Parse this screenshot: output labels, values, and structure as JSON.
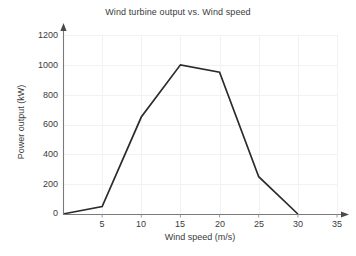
{
  "chart_data": {
    "type": "line",
    "title": "Wind turbine output vs. Wind speed",
    "xlabel": "Wind speed (m/s)",
    "ylabel": "Power output (kW)",
    "x": [
      0,
      5,
      10,
      15,
      20,
      25,
      30
    ],
    "values": [
      0,
      50,
      650,
      1000,
      950,
      250,
      0
    ],
    "series": [
      {
        "name": "Power output",
        "x": [
          0,
          5,
          10,
          15,
          20,
          25,
          30
        ],
        "values": [
          0,
          50,
          650,
          1000,
          950,
          250,
          0
        ]
      }
    ],
    "xlim": [
      0,
      35
    ],
    "ylim": [
      0,
      1200
    ],
    "xticks": [
      0,
      5,
      10,
      15,
      20,
      25,
      30,
      35
    ],
    "xtick_labels": [
      "",
      "5",
      "10",
      "15",
      "20",
      "25",
      "30",
      "35"
    ],
    "yticks": [
      0,
      200,
      400,
      600,
      800,
      1000,
      1200
    ],
    "ytick_labels": [
      "0",
      "200",
      "400",
      "600",
      "800",
      "1000",
      "1200"
    ],
    "grid": true,
    "legend": null,
    "legend_position": "none",
    "line_color": "#2b2b2b",
    "grid_color": "#f2f2f4",
    "axis_color": "#7a7a7a",
    "text_color": "#3b3b3b",
    "background_color": "#ffffff",
    "markers": false,
    "axis_arrows": true
  }
}
